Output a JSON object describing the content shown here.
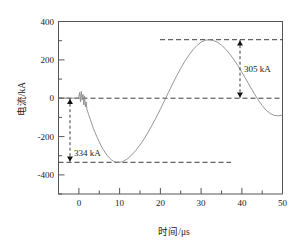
{
  "figure": {
    "background": "#ffffff",
    "axis_color": "#555555",
    "curve_color": "#8a8a8a",
    "dash_color": "#3c3c3c",
    "text_color": "#1a1a1a"
  },
  "chart_data": {
    "type": "line",
    "title": "",
    "xlabel": "时间/μs",
    "ylabel": "电流/kA",
    "xlim": [
      -5,
      50
    ],
    "ylim": [
      -500,
      400
    ],
    "grid": false,
    "legend": null,
    "x_ticks": [
      0,
      10,
      20,
      30,
      40,
      50
    ],
    "x_tick_labels": [
      "0",
      "10",
      "20",
      "30",
      "40",
      "50"
    ],
    "x_minor_ticks": [
      -5,
      5,
      15,
      25,
      35,
      45
    ],
    "y_ticks": [
      400,
      200,
      0,
      -200,
      -400
    ],
    "y_tick_labels": [
      "400",
      "200",
      "0",
      "-200",
      "-400"
    ],
    "y_minor_ticks": [
      300,
      100,
      -100,
      -300,
      -500
    ],
    "series": [
      {
        "name": "current",
        "x": [
          -5.0,
          -4.0,
          -3.0,
          -2.0,
          -1.0,
          -0.4,
          -0.2,
          0.0,
          0.2,
          0.4,
          0.6,
          0.8,
          1.0,
          1.2,
          1.4,
          1.6,
          1.8,
          2.0,
          2.4,
          2.8,
          3.2,
          3.6,
          4.0,
          4.5,
          5.0,
          5.5,
          6.0,
          6.5,
          7.0,
          7.5,
          8.0,
          8.5,
          9.0,
          9.5,
          10.0,
          10.5,
          11.0,
          11.5,
          12.0,
          13.0,
          14.0,
          15.0,
          16.0,
          17.0,
          18.0,
          19.0,
          20.0,
          21.0,
          22.0,
          23.0,
          24.0,
          25.0,
          26.0,
          27.0,
          28.0,
          29.0,
          30.0,
          31.0,
          32.0,
          33.0,
          34.0,
          35.0,
          36.0,
          37.0,
          38.0,
          39.0,
          40.0,
          41.0,
          42.0,
          43.0,
          44.0,
          45.0,
          46.0,
          47.0,
          48.0,
          49.0,
          50.0
        ],
        "y": [
          0,
          0,
          0,
          0,
          0,
          2,
          -4,
          10,
          30,
          -20,
          35,
          -10,
          20,
          -35,
          12,
          -45,
          -20,
          -60,
          -85,
          -110,
          -135,
          -160,
          -180,
          -205,
          -228,
          -250,
          -268,
          -285,
          -300,
          -312,
          -322,
          -329,
          -333,
          -334,
          -334,
          -332,
          -328,
          -322,
          -315,
          -296,
          -272,
          -245,
          -213,
          -178,
          -140,
          -100,
          -58,
          -14,
          30,
          74,
          116,
          155,
          192,
          224,
          252,
          275,
          292,
          302,
          305,
          301,
          292,
          277,
          257,
          232,
          203,
          171,
          136,
          100,
          63,
          26,
          -8,
          -38,
          -63,
          -80,
          -90,
          -92,
          -88
        ]
      }
    ],
    "annotations": [
      {
        "id": "trough-measure",
        "label": "334 kA",
        "value": 334,
        "unit": "kA",
        "from_y": 0,
        "to_y": -334,
        "at_x": 1.0
      },
      {
        "id": "peak-measure",
        "label": "305 kA",
        "value": 305,
        "unit": "kA",
        "from_y": 305,
        "to_y": 0,
        "at_x": 42.0
      }
    ],
    "reference_lines": [
      {
        "id": "zero-line",
        "y": 0,
        "style": "dashed",
        "span": "full"
      },
      {
        "id": "trough-line",
        "y": -334,
        "style": "dashed",
        "span": "left"
      },
      {
        "id": "peak-line",
        "y": 305,
        "style": "dashed",
        "span": "right"
      }
    ]
  }
}
